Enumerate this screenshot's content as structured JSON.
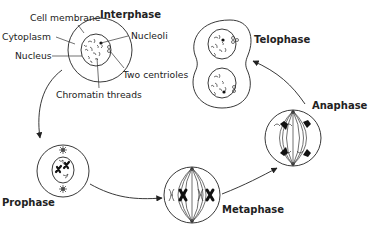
{
  "diagram": {
    "phases": {
      "interphase": "Interphase",
      "prophase": "Prophase",
      "metaphase": "Metaphase",
      "anaphase": "Anaphase",
      "telophase": "Telophase"
    },
    "labels": {
      "cell_membrane": "Cell membrane",
      "cytoplasm": "Cytoplasm",
      "nucleus": "Nucleus",
      "nucleoli": "Nucleoli",
      "two_centrioles": "Two centrioles",
      "chromatin_threads": "Chromatin threads"
    },
    "sequence": [
      "Interphase",
      "Prophase",
      "Metaphase",
      "Anaphase",
      "Telophase"
    ],
    "colors": {
      "line": "#222222",
      "background": "#ffffff"
    }
  }
}
